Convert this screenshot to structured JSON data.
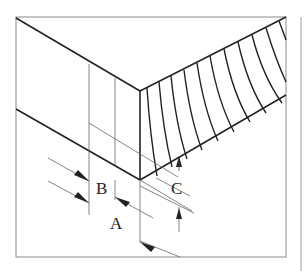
{
  "diagram": {
    "labels": {
      "a": "A",
      "b": "B",
      "c": "C"
    },
    "colors": {
      "line": "#222222",
      "thin_line": "#555555",
      "frame": "#888888",
      "background": "#ffffff"
    }
  }
}
